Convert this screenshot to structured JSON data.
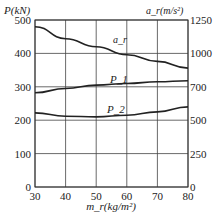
{
  "chart_data": {
    "type": "line",
    "title": "",
    "xlabel": "m_r (kg/m²)",
    "ylabel": "P (kN)",
    "ylabel_right": "a_r (m/s²)",
    "x": [
      30,
      40,
      50,
      60,
      70,
      80
    ],
    "xlim": [
      30,
      80
    ],
    "ylim": [
      0,
      500
    ],
    "ylim_right": [
      0,
      1250
    ],
    "x_ticks": [
      "30",
      "40",
      "50",
      "60",
      "70",
      "80"
    ],
    "y_ticks": [
      "0",
      "100",
      "200",
      "300",
      "400",
      "500"
    ],
    "y_ticks_right": [
      "0",
      "250",
      "500",
      "750",
      "1000",
      "1250"
    ],
    "grid": true,
    "series": [
      {
        "name": "a_r",
        "axis": "right",
        "values": [
          1200,
          1110,
          1050,
          990,
          940,
          890
        ]
      },
      {
        "name": "P1",
        "axis": "left",
        "values": [
          282,
          295,
          305,
          310,
          315,
          318
        ]
      },
      {
        "name": "P2",
        "axis": "left",
        "values": [
          222,
          212,
          210,
          215,
          225,
          240
        ]
      }
    ],
    "right_tick_labels_shown": [
      "0",
      "250",
      "500",
      "700",
      "1000",
      "1250"
    ]
  },
  "labels": {
    "y_left": "P(kN)",
    "y_right": "a_r(m/s²)",
    "x_axis": "m_r(kg/m²)",
    "series_ar": "a_r",
    "series_p1": "P_1",
    "series_p2": "P_2"
  }
}
